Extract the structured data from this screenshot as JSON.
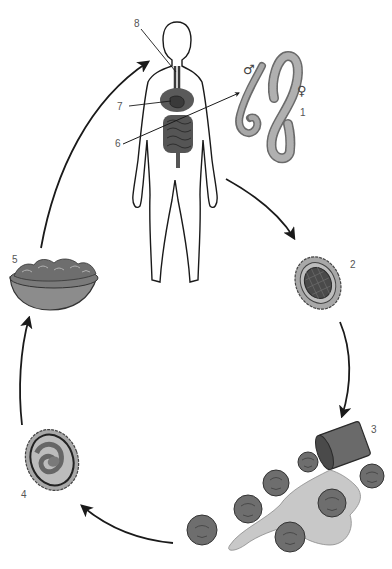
{
  "diagram": {
    "type": "life-cycle",
    "stages": [
      {
        "number": "1",
        "name": "adult-worms",
        "description": "Adult male and female worms",
        "symbols": [
          "♂",
          "♀"
        ]
      },
      {
        "number": "2",
        "name": "egg",
        "description": "Fertilized egg with segmented cells"
      },
      {
        "number": "3",
        "name": "contaminated-vegetables",
        "description": "Eggs spread via spilled water onto lettuce/vegetables"
      },
      {
        "number": "4",
        "name": "embryonated-egg",
        "description": "Egg containing coiled larva"
      },
      {
        "number": "5",
        "name": "contaminated-food",
        "description": "Bowl of salad / raw food"
      }
    ],
    "body_labels": [
      {
        "number": "6",
        "name": "intestine-label"
      },
      {
        "number": "7",
        "name": "lungs-label"
      },
      {
        "number": "8",
        "name": "trachea-label"
      }
    ],
    "flow": [
      "human-body",
      "2",
      "3",
      "4",
      "5",
      "human-body"
    ]
  },
  "labels": {
    "l1": "1",
    "l2": "2",
    "l3": "3",
    "l4": "4",
    "l5": "5",
    "l6": "6",
    "l7": "7",
    "l8": "8",
    "male": "♂",
    "female": "♀"
  },
  "colors": {
    "line": "#1a1a1a",
    "organ": "#5a5a5a",
    "worm_fill": "#9a9a9a",
    "egg_shell": "#a8a8a8",
    "egg_core": "#4a4a4a",
    "lettuce": "#6e6e6e",
    "water": "#c8c8c8",
    "bowl": "#8c8c8c"
  }
}
